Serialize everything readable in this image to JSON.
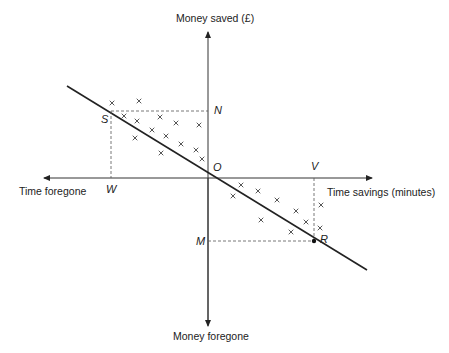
{
  "diagram": {
    "axes": {
      "y_positive": "Money saved (£)",
      "y_negative": "Money foregone",
      "x_positive": "Time savings (minutes)",
      "x_negative": "Time foregone"
    },
    "points": {
      "origin": "O",
      "S": "S",
      "N": "N",
      "W": "W",
      "V": "V",
      "M": "M",
      "R": "R"
    },
    "colors": {
      "ink": "#222222",
      "background": "#ffffff"
    },
    "marker": "×",
    "crosses_upper_left": [
      [
        112,
        103
      ],
      [
        139,
        101
      ],
      [
        124,
        116
      ],
      [
        137,
        121
      ],
      [
        160,
        117
      ],
      [
        176,
        123
      ],
      [
        199,
        125
      ],
      [
        152,
        130
      ],
      [
        166,
        136
      ],
      [
        181,
        144
      ],
      [
        135,
        138
      ],
      [
        161,
        153
      ],
      [
        196,
        150
      ],
      [
        202,
        159
      ]
    ],
    "crosses_lower_right": [
      [
        241,
        185
      ],
      [
        233,
        196
      ],
      [
        258,
        191
      ],
      [
        277,
        200
      ],
      [
        296,
        211
      ],
      [
        261,
        220
      ],
      [
        306,
        222
      ],
      [
        321,
        205
      ],
      [
        291,
        232
      ],
      [
        320,
        228
      ]
    ]
  }
}
